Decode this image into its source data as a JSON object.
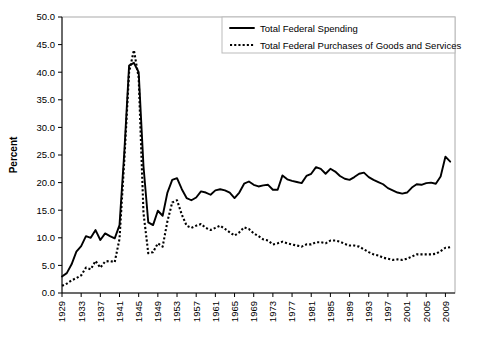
{
  "chart_data": {
    "type": "line",
    "title": "",
    "xlabel": "",
    "ylabel": "Percent",
    "ylim": [
      0,
      50
    ],
    "yticks": [
      0,
      5,
      10,
      15,
      20,
      25,
      30,
      35,
      40,
      45,
      50
    ],
    "ytick_labels": [
      "0.0",
      "5.0",
      "10.0",
      "15.0",
      "20.0",
      "25.0",
      "30.0",
      "35.0",
      "40.0",
      "45.0",
      "50.0"
    ],
    "xlim": [
      1929,
      2011
    ],
    "xtick_labels": [
      "1929",
      "1933",
      "1937",
      "1941",
      "1945",
      "1949",
      "1953",
      "1957",
      "1961",
      "1965",
      "1969",
      "1973",
      "1977",
      "1981",
      "1985",
      "1989",
      "1993",
      "1997",
      "2001",
      "2005",
      "2009"
    ],
    "xticks": [
      1929,
      1933,
      1937,
      1941,
      1945,
      1949,
      1953,
      1957,
      1961,
      1965,
      1969,
      1973,
      1977,
      1981,
      1985,
      1989,
      1993,
      1997,
      2001,
      2005,
      2009
    ],
    "grid": false,
    "legend_position": "top-right",
    "x": [
      1929,
      1930,
      1931,
      1932,
      1933,
      1934,
      1935,
      1936,
      1937,
      1938,
      1939,
      1940,
      1941,
      1942,
      1943,
      1944,
      1945,
      1946,
      1947,
      1948,
      1949,
      1950,
      1951,
      1952,
      1953,
      1954,
      1955,
      1956,
      1957,
      1958,
      1959,
      1960,
      1961,
      1962,
      1963,
      1964,
      1965,
      1966,
      1967,
      1968,
      1969,
      1970,
      1971,
      1972,
      1973,
      1974,
      1975,
      1976,
      1977,
      1978,
      1979,
      1980,
      1981,
      1982,
      1983,
      1984,
      1985,
      1986,
      1987,
      1988,
      1989,
      1990,
      1991,
      1992,
      1993,
      1994,
      1995,
      1996,
      1997,
      1998,
      1999,
      2000,
      2001,
      2002,
      2003,
      2004,
      2005,
      2006,
      2007,
      2008,
      2009,
      2010
    ],
    "series": [
      {
        "name": "Total Federal Spending",
        "style": "solid",
        "color": "#000000",
        "values": [
          3.0,
          3.6,
          5.2,
          7.5,
          8.5,
          10.3,
          10.0,
          11.4,
          9.6,
          10.8,
          10.3,
          9.9,
          12.3,
          25.5,
          41.2,
          41.7,
          40.0,
          23.0,
          12.8,
          12.3,
          14.9,
          14.0,
          18.2,
          20.5,
          20.8,
          18.8,
          17.2,
          16.8,
          17.3,
          18.4,
          18.2,
          17.8,
          18.6,
          18.8,
          18.6,
          18.2,
          17.2,
          18.2,
          19.8,
          20.2,
          19.6,
          19.3,
          19.5,
          19.6,
          18.7,
          18.7,
          21.3,
          20.6,
          20.3,
          20.1,
          19.9,
          21.2,
          21.6,
          22.8,
          22.5,
          21.6,
          22.5,
          22.0,
          21.2,
          20.7,
          20.5,
          21.0,
          21.6,
          21.8,
          21.0,
          20.5,
          20.1,
          19.7,
          19.0,
          18.6,
          18.2,
          18.0,
          18.2,
          19.1,
          19.7,
          19.6,
          19.9,
          20.0,
          19.8,
          21.1,
          24.7,
          23.8
        ]
      },
      {
        "name": "Total Federal Purchases of Goods and Services",
        "style": "dotted",
        "color": "#000000",
        "values": [
          1.3,
          1.7,
          2.3,
          2.7,
          3.2,
          4.6,
          4.3,
          5.8,
          4.6,
          5.7,
          5.8,
          5.6,
          9.8,
          24.0,
          40.0,
          44.0,
          39.0,
          14.5,
          7.2,
          7.4,
          9.0,
          8.4,
          13.0,
          16.4,
          16.8,
          14.2,
          12.2,
          11.8,
          12.2,
          12.5,
          11.8,
          11.4,
          11.8,
          12.2,
          11.6,
          11.0,
          10.4,
          11.0,
          11.9,
          11.6,
          10.8,
          10.3,
          9.7,
          9.5,
          8.8,
          9.0,
          9.3,
          9.0,
          8.8,
          8.6,
          8.4,
          8.8,
          8.8,
          9.2,
          9.2,
          9.0,
          9.5,
          9.5,
          9.3,
          8.9,
          8.6,
          8.6,
          8.4,
          7.9,
          7.4,
          7.0,
          6.8,
          6.4,
          6.2,
          6.0,
          6.1,
          6.0,
          6.2,
          6.6,
          7.0,
          7.0,
          7.0,
          7.0,
          7.1,
          7.6,
          8.2,
          8.3
        ]
      }
    ],
    "legend": [
      {
        "label": "Total Federal Spending",
        "style": "solid"
      },
      {
        "label": "Total Federal Purchases of Goods and Services",
        "style": "dotted"
      }
    ]
  },
  "figure": {
    "caption": ""
  }
}
